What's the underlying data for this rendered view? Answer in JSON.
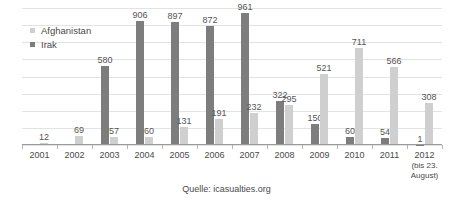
{
  "chart_data": {
    "type": "bar",
    "title": "",
    "subtitle": "",
    "xlabel": "",
    "ylabel": "",
    "ylim": [
      0,
      1000
    ],
    "grid": true,
    "gridlines": [
      0,
      125,
      250,
      375,
      500,
      625,
      750,
      875,
      1000
    ],
    "legend_position": "top-left",
    "categories": [
      "2001",
      "2002",
      "2003",
      "2004",
      "2005",
      "2006",
      "2007",
      "2008",
      "2009",
      "2010",
      "2011",
      "2012"
    ],
    "category_sublabels": [
      "",
      "",
      "",
      "",
      "",
      "",
      "",
      "",
      "",
      "",
      "",
      "(bis 23. August)"
    ],
    "series": [
      {
        "name": "Irak",
        "color": "#7d7d7d",
        "values": [
          0,
          0,
          580,
          906,
          897,
          872,
          961,
          322,
          150,
          60,
          54,
          1
        ],
        "labels": [
          "",
          "",
          "580",
          "906",
          "897",
          "872",
          "961",
          "322",
          "150",
          "60",
          "54",
          "1"
        ]
      },
      {
        "name": "Afghanistan",
        "color": "#cfcfcf",
        "values": [
          12,
          69,
          57,
          60,
          131,
          191,
          232,
          295,
          521,
          711,
          566,
          308
        ],
        "labels": [
          "12",
          "69",
          "57",
          "60",
          "131",
          "191",
          "232",
          "295",
          "521",
          "711",
          "566",
          "308"
        ]
      }
    ],
    "caption": "Quelle: icasualties.org"
  },
  "legend": {
    "items": [
      {
        "label": "Afghanistan",
        "series": "afghanistan"
      },
      {
        "label": "Irak",
        "series": "irak"
      }
    ]
  }
}
